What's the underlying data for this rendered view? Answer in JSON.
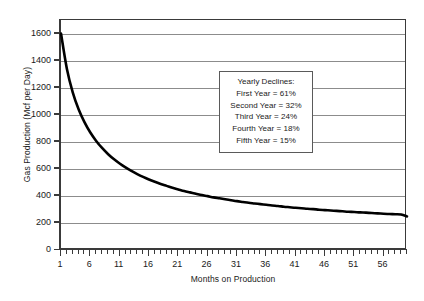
{
  "chart_data": {
    "type": "line",
    "title": "",
    "xlabel": "Months on Production",
    "ylabel": "Gas Production (Mcf per Day)",
    "xlim": [
      1,
      60
    ],
    "ylim": [
      0,
      1700
    ],
    "ytick_step": 200,
    "yticks": [
      0,
      200,
      400,
      600,
      800,
      1000,
      1200,
      1400,
      1600
    ],
    "ytick_labels": [
      "0",
      "200",
      "400",
      "600",
      "800",
      "1000",
      "1200",
      "1400",
      "1600"
    ],
    "xticks": [
      1,
      6,
      11,
      16,
      21,
      26,
      31,
      36,
      41,
      46,
      51,
      56
    ],
    "xtick_labels": [
      "1",
      "6",
      "11",
      "16",
      "21",
      "26",
      "31",
      "36",
      "41",
      "46",
      "51",
      "56"
    ],
    "xtick_minor_step": 1,
    "grid": "horizontal",
    "legend": "none",
    "line_color": "#000000",
    "line_width": 2.6,
    "series": [
      {
        "name": "Gas Production Decline Curve",
        "x": [
          1,
          2,
          3,
          4,
          5,
          6,
          7,
          8,
          9,
          10,
          11,
          12,
          13,
          14,
          15,
          16,
          17,
          18,
          19,
          20,
          21,
          22,
          23,
          24,
          25,
          26,
          27,
          28,
          29,
          30,
          31,
          32,
          33,
          34,
          35,
          36,
          37,
          38,
          39,
          40,
          41,
          42,
          43,
          44,
          45,
          46,
          47,
          48,
          49,
          50,
          51,
          52,
          53,
          54,
          55,
          56,
          57,
          58,
          59,
          60
        ],
        "values": [
          1600,
          1340,
          1165,
          1040,
          945,
          868,
          806,
          754,
          710,
          672,
          639,
          610,
          584,
          561,
          540,
          521,
          504,
          488,
          474,
          460,
          448,
          436,
          426,
          416,
          406,
          398,
          389,
          382,
          375,
          368,
          361,
          355,
          349,
          344,
          339,
          334,
          329,
          325,
          320,
          316,
          312,
          309,
          305,
          302,
          298,
          295,
          292,
          289,
          286,
          283,
          281,
          278,
          276,
          273,
          271,
          268,
          266,
          264,
          262,
          248
        ]
      }
    ],
    "annotations": {
      "yearly_declines": {
        "title": "Yearly Declines:",
        "lines": [
          "First Year = 61%",
          "Second Year = 32%",
          "Third Year = 24%",
          "Fourth Year = 18%",
          "Fifth Year = 15%"
        ]
      }
    }
  }
}
